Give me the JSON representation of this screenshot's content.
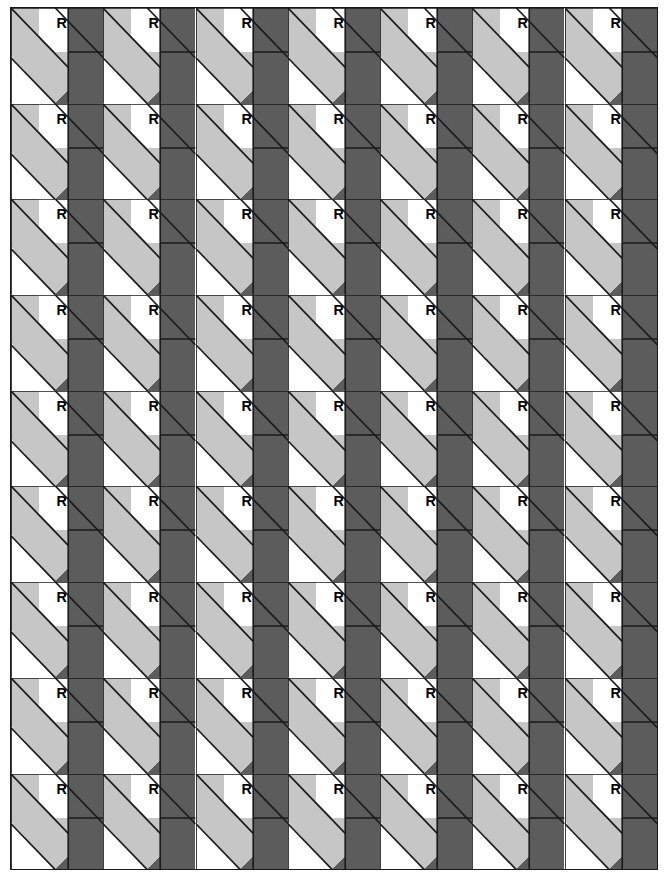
{
  "figure": {
    "glyph": "R",
    "border_color": "#1a1a1a",
    "stroke_color": "#1a1a1a",
    "background_color": "#ffffff"
  },
  "palette": {
    "white": "#ffffff",
    "light_gray": "#c6c6c6",
    "dark_gray": "#5c5c5c",
    "outline": "#1a1a1a"
  },
  "grid": {
    "columns": 7,
    "rows": 9,
    "tile_width": 92.4,
    "tile_height": 95.7,
    "total_tiles": 63
  },
  "chart_data": {
    "type": "heatmap",
    "xlabel": "",
    "ylabel": "",
    "categories": [
      "c1",
      "c2",
      "c3",
      "c4",
      "c5",
      "c6",
      "c7"
    ],
    "rows": [
      "r1",
      "r2",
      "r3",
      "r4",
      "r5",
      "r6",
      "r7",
      "r8",
      "r9"
    ],
    "series": [
      {
        "name": "r1",
        "values": [
          "R",
          "R",
          "R",
          "R",
          "R",
          "R",
          "R"
        ]
      },
      {
        "name": "r2",
        "values": [
          "R",
          "R",
          "R",
          "R",
          "R",
          "R",
          "R"
        ]
      },
      {
        "name": "r3",
        "values": [
          "R",
          "R",
          "R",
          "R",
          "R",
          "R",
          "R"
        ]
      },
      {
        "name": "r4",
        "values": [
          "R",
          "R",
          "R",
          "R",
          "R",
          "R",
          "R"
        ]
      },
      {
        "name": "r5",
        "values": [
          "R",
          "R",
          "R",
          "R",
          "R",
          "R",
          "R"
        ]
      },
      {
        "name": "r6",
        "values": [
          "R",
          "R",
          "R",
          "R",
          "R",
          "R",
          "R"
        ]
      },
      {
        "name": "r7",
        "values": [
          "R",
          "R",
          "R",
          "R",
          "R",
          "R",
          "R"
        ]
      },
      {
        "name": "r8",
        "values": [
          "R",
          "R",
          "R",
          "R",
          "R",
          "R",
          "R"
        ]
      },
      {
        "name": "r9",
        "values": [
          "R",
          "R",
          "R",
          "R",
          "R",
          "R",
          "R"
        ]
      }
    ]
  },
  "tile_geometry": {
    "viewbox": "0 0 100 100",
    "shapes": [
      {
        "name": "top-left-light-triangle",
        "fill": "#c6c6c6",
        "points": "0,0 0,52 50,0"
      },
      {
        "name": "top-white-label-square",
        "fill": "#ffffff",
        "points": "50,0 100,0 100,48 50,48"
      },
      {
        "name": "right-dark-block",
        "fill": "#5c5c5c",
        "points": "62,0 100,0 100,100 62,100"
      },
      {
        "name": "light-diagonal-band",
        "fill": "#c6c6c6",
        "points": "0,55 48,0 100,0 100,52 45,100 0,100"
      },
      {
        "name": "lower-white-wedge",
        "fill": "#ffffff",
        "points": "0,56 0,100 44,100"
      }
    ]
  }
}
